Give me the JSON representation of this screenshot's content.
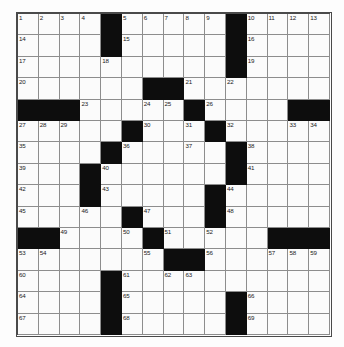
{
  "puzzle": {
    "type": "crossword-grid",
    "rows": 15,
    "cols": 15,
    "colors": {
      "block": "#0d0d0d",
      "cell": "#fbfbfb",
      "grid_line": "#8d8d8d",
      "frame": "#4a4a4a",
      "number_text": "#1a1a1a",
      "page_background": "#ffffff"
    },
    "grid": [
      [
        {
          "type": "white",
          "number": "1"
        },
        {
          "type": "white",
          "number": "2"
        },
        {
          "type": "white",
          "number": "3"
        },
        {
          "type": "white",
          "number": "4"
        },
        {
          "type": "block",
          "number": ""
        },
        {
          "type": "white",
          "number": "5"
        },
        {
          "type": "white",
          "number": "6"
        },
        {
          "type": "white",
          "number": "7"
        },
        {
          "type": "white",
          "number": "8"
        },
        {
          "type": "white",
          "number": "9"
        },
        {
          "type": "block",
          "number": ""
        },
        {
          "type": "white",
          "number": "10"
        },
        {
          "type": "white",
          "number": "11"
        },
        {
          "type": "white",
          "number": "12"
        },
        {
          "type": "white",
          "number": "13"
        }
      ],
      [
        {
          "type": "white",
          "number": "14"
        },
        {
          "type": "white",
          "number": ""
        },
        {
          "type": "white",
          "number": ""
        },
        {
          "type": "white",
          "number": ""
        },
        {
          "type": "block",
          "number": ""
        },
        {
          "type": "white",
          "number": "15"
        },
        {
          "type": "white",
          "number": ""
        },
        {
          "type": "white",
          "number": ""
        },
        {
          "type": "white",
          "number": ""
        },
        {
          "type": "white",
          "number": ""
        },
        {
          "type": "block",
          "number": ""
        },
        {
          "type": "white",
          "number": "16"
        },
        {
          "type": "white",
          "number": ""
        },
        {
          "type": "white",
          "number": ""
        },
        {
          "type": "white",
          "number": ""
        }
      ],
      [
        {
          "type": "white",
          "number": "17"
        },
        {
          "type": "white",
          "number": ""
        },
        {
          "type": "white",
          "number": ""
        },
        {
          "type": "white",
          "number": ""
        },
        {
          "type": "white",
          "number": "18"
        },
        {
          "type": "white",
          "number": ""
        },
        {
          "type": "white",
          "number": ""
        },
        {
          "type": "white",
          "number": ""
        },
        {
          "type": "white",
          "number": ""
        },
        {
          "type": "white",
          "number": ""
        },
        {
          "type": "block",
          "number": ""
        },
        {
          "type": "white",
          "number": "19"
        },
        {
          "type": "white",
          "number": ""
        },
        {
          "type": "white",
          "number": ""
        },
        {
          "type": "white",
          "number": ""
        }
      ],
      [
        {
          "type": "white",
          "number": "20"
        },
        {
          "type": "white",
          "number": ""
        },
        {
          "type": "white",
          "number": ""
        },
        {
          "type": "white",
          "number": ""
        },
        {
          "type": "white",
          "number": ""
        },
        {
          "type": "white",
          "number": ""
        },
        {
          "type": "block",
          "number": ""
        },
        {
          "type": "block",
          "number": ""
        },
        {
          "type": "white",
          "number": "21"
        },
        {
          "type": "white",
          "number": ""
        },
        {
          "type": "white",
          "number": "22"
        },
        {
          "type": "white",
          "number": ""
        },
        {
          "type": "white",
          "number": ""
        },
        {
          "type": "white",
          "number": ""
        },
        {
          "type": "white",
          "number": ""
        }
      ],
      [
        {
          "type": "block",
          "number": ""
        },
        {
          "type": "block",
          "number": ""
        },
        {
          "type": "block",
          "number": ""
        },
        {
          "type": "white",
          "number": "23"
        },
        {
          "type": "white",
          "number": ""
        },
        {
          "type": "white",
          "number": ""
        },
        {
          "type": "white",
          "number": "24"
        },
        {
          "type": "white",
          "number": "25"
        },
        {
          "type": "block",
          "number": ""
        },
        {
          "type": "white",
          "number": "26"
        },
        {
          "type": "white",
          "number": ""
        },
        {
          "type": "white",
          "number": ""
        },
        {
          "type": "white",
          "number": ""
        },
        {
          "type": "block",
          "number": ""
        },
        {
          "type": "block",
          "number": ""
        }
      ],
      [
        {
          "type": "white",
          "number": "27"
        },
        {
          "type": "white",
          "number": "28"
        },
        {
          "type": "white",
          "number": "29"
        },
        {
          "type": "white",
          "number": ""
        },
        {
          "type": "white",
          "number": ""
        },
        {
          "type": "block",
          "number": ""
        },
        {
          "type": "white",
          "number": "30"
        },
        {
          "type": "white",
          "number": ""
        },
        {
          "type": "white",
          "number": "31"
        },
        {
          "type": "block",
          "number": ""
        },
        {
          "type": "white",
          "number": "32"
        },
        {
          "type": "white",
          "number": ""
        },
        {
          "type": "white",
          "number": ""
        },
        {
          "type": "white",
          "number": "33"
        },
        {
          "type": "white",
          "number": "34"
        }
      ],
      [
        {
          "type": "white",
          "number": "35"
        },
        {
          "type": "white",
          "number": ""
        },
        {
          "type": "white",
          "number": ""
        },
        {
          "type": "white",
          "number": ""
        },
        {
          "type": "block",
          "number": ""
        },
        {
          "type": "white",
          "number": "36"
        },
        {
          "type": "white",
          "number": ""
        },
        {
          "type": "white",
          "number": ""
        },
        {
          "type": "white",
          "number": "37"
        },
        {
          "type": "white",
          "number": ""
        },
        {
          "type": "block",
          "number": ""
        },
        {
          "type": "white",
          "number": "38"
        },
        {
          "type": "white",
          "number": ""
        },
        {
          "type": "white",
          "number": ""
        },
        {
          "type": "white",
          "number": ""
        }
      ],
      [
        {
          "type": "white",
          "number": "39"
        },
        {
          "type": "white",
          "number": ""
        },
        {
          "type": "white",
          "number": ""
        },
        {
          "type": "block",
          "number": ""
        },
        {
          "type": "white",
          "number": "40"
        },
        {
          "type": "white",
          "number": ""
        },
        {
          "type": "white",
          "number": ""
        },
        {
          "type": "white",
          "number": ""
        },
        {
          "type": "white",
          "number": ""
        },
        {
          "type": "white",
          "number": ""
        },
        {
          "type": "block",
          "number": ""
        },
        {
          "type": "white",
          "number": "41"
        },
        {
          "type": "white",
          "number": ""
        },
        {
          "type": "white",
          "number": ""
        },
        {
          "type": "white",
          "number": ""
        }
      ],
      [
        {
          "type": "white",
          "number": "42"
        },
        {
          "type": "white",
          "number": ""
        },
        {
          "type": "white",
          "number": ""
        },
        {
          "type": "block",
          "number": ""
        },
        {
          "type": "white",
          "number": "43"
        },
        {
          "type": "white",
          "number": ""
        },
        {
          "type": "white",
          "number": ""
        },
        {
          "type": "white",
          "number": ""
        },
        {
          "type": "white",
          "number": ""
        },
        {
          "type": "block",
          "number": ""
        },
        {
          "type": "white",
          "number": "44"
        },
        {
          "type": "white",
          "number": ""
        },
        {
          "type": "white",
          "number": ""
        },
        {
          "type": "white",
          "number": ""
        },
        {
          "type": "white",
          "number": ""
        }
      ],
      [
        {
          "type": "white",
          "number": "45"
        },
        {
          "type": "white",
          "number": ""
        },
        {
          "type": "white",
          "number": ""
        },
        {
          "type": "white",
          "number": "46"
        },
        {
          "type": "white",
          "number": ""
        },
        {
          "type": "block",
          "number": ""
        },
        {
          "type": "white",
          "number": "47"
        },
        {
          "type": "white",
          "number": ""
        },
        {
          "type": "white",
          "number": ""
        },
        {
          "type": "block",
          "number": ""
        },
        {
          "type": "white",
          "number": "48"
        },
        {
          "type": "white",
          "number": ""
        },
        {
          "type": "white",
          "number": ""
        },
        {
          "type": "white",
          "number": ""
        },
        {
          "type": "white",
          "number": ""
        }
      ],
      [
        {
          "type": "block",
          "number": ""
        },
        {
          "type": "block",
          "number": ""
        },
        {
          "type": "white",
          "number": "49"
        },
        {
          "type": "white",
          "number": ""
        },
        {
          "type": "white",
          "number": ""
        },
        {
          "type": "white",
          "number": "50"
        },
        {
          "type": "block",
          "number": ""
        },
        {
          "type": "white",
          "number": "51"
        },
        {
          "type": "white",
          "number": ""
        },
        {
          "type": "white",
          "number": "52"
        },
        {
          "type": "white",
          "number": ""
        },
        {
          "type": "white",
          "number": ""
        },
        {
          "type": "block",
          "number": ""
        },
        {
          "type": "block",
          "number": ""
        },
        {
          "type": "block",
          "number": ""
        }
      ],
      [
        {
          "type": "white",
          "number": "53"
        },
        {
          "type": "white",
          "number": "54"
        },
        {
          "type": "white",
          "number": ""
        },
        {
          "type": "white",
          "number": ""
        },
        {
          "type": "white",
          "number": ""
        },
        {
          "type": "white",
          "number": ""
        },
        {
          "type": "white",
          "number": "55"
        },
        {
          "type": "block",
          "number": ""
        },
        {
          "type": "block",
          "number": ""
        },
        {
          "type": "white",
          "number": "56"
        },
        {
          "type": "white",
          "number": ""
        },
        {
          "type": "white",
          "number": ""
        },
        {
          "type": "white",
          "number": "57"
        },
        {
          "type": "white",
          "number": "58"
        },
        {
          "type": "white",
          "number": "59"
        }
      ],
      [
        {
          "type": "white",
          "number": "60"
        },
        {
          "type": "white",
          "number": ""
        },
        {
          "type": "white",
          "number": ""
        },
        {
          "type": "white",
          "number": ""
        },
        {
          "type": "block",
          "number": ""
        },
        {
          "type": "white",
          "number": "61"
        },
        {
          "type": "white",
          "number": ""
        },
        {
          "type": "white",
          "number": "62"
        },
        {
          "type": "white",
          "number": "63"
        },
        {
          "type": "white",
          "number": ""
        },
        {
          "type": "white",
          "number": ""
        },
        {
          "type": "white",
          "number": ""
        },
        {
          "type": "white",
          "number": ""
        },
        {
          "type": "white",
          "number": ""
        },
        {
          "type": "white",
          "number": ""
        }
      ],
      [
        {
          "type": "white",
          "number": "64"
        },
        {
          "type": "white",
          "number": ""
        },
        {
          "type": "white",
          "number": ""
        },
        {
          "type": "white",
          "number": ""
        },
        {
          "type": "block",
          "number": ""
        },
        {
          "type": "white",
          "number": "65"
        },
        {
          "type": "white",
          "number": ""
        },
        {
          "type": "white",
          "number": ""
        },
        {
          "type": "white",
          "number": ""
        },
        {
          "type": "white",
          "number": ""
        },
        {
          "type": "block",
          "number": ""
        },
        {
          "type": "white",
          "number": "66"
        },
        {
          "type": "white",
          "number": ""
        },
        {
          "type": "white",
          "number": ""
        },
        {
          "type": "white",
          "number": ""
        }
      ],
      [
        {
          "type": "white",
          "number": "67"
        },
        {
          "type": "white",
          "number": ""
        },
        {
          "type": "white",
          "number": ""
        },
        {
          "type": "white",
          "number": ""
        },
        {
          "type": "block",
          "number": ""
        },
        {
          "type": "white",
          "number": "68"
        },
        {
          "type": "white",
          "number": ""
        },
        {
          "type": "white",
          "number": ""
        },
        {
          "type": "white",
          "number": ""
        },
        {
          "type": "white",
          "number": ""
        },
        {
          "type": "block",
          "number": ""
        },
        {
          "type": "white",
          "number": "69"
        },
        {
          "type": "white",
          "number": ""
        },
        {
          "type": "white",
          "number": ""
        },
        {
          "type": "white",
          "number": ""
        }
      ]
    ]
  }
}
